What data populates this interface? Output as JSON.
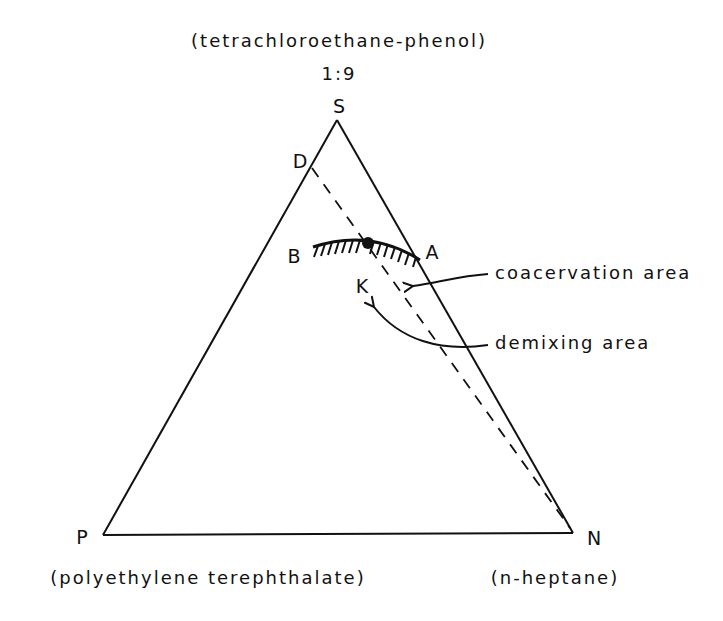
{
  "diagram": {
    "type": "ternary-phase-diagram",
    "vertices": {
      "S": {
        "label": "S",
        "component": "(tetrachloroethane-phenol)",
        "ratio": "1:9"
      },
      "P": {
        "label": "P",
        "component": "(polyethylene terephthalate)"
      },
      "N": {
        "label": "N",
        "component": "(n-heptane)"
      }
    },
    "points": {
      "D": "D",
      "B": "B",
      "A": "A",
      "K": "K"
    },
    "annotations": {
      "coacervation": "coacervation area",
      "demixing": "demixing area"
    },
    "colors": {
      "ink": "#111111",
      "background": "#ffffff"
    }
  }
}
